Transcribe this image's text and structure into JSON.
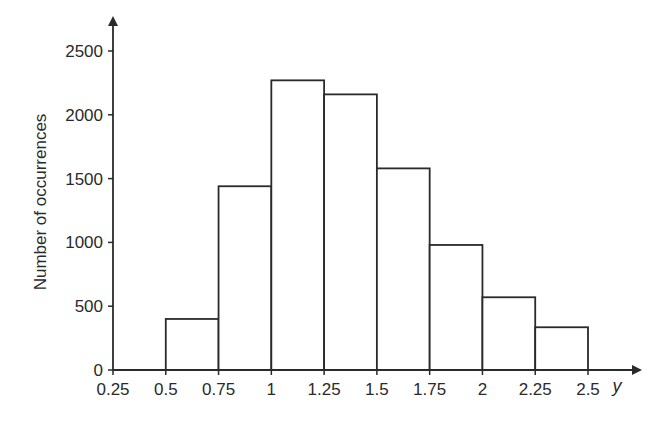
{
  "chart_data": {
    "type": "bar",
    "subtype": "histogram",
    "title": "",
    "xlabel": "y",
    "ylabel": "Number of occurrences",
    "bin_edges": [
      0.5,
      0.75,
      1,
      1.25,
      1.5,
      1.75,
      2,
      2.25,
      2.5
    ],
    "categories": [
      "0.5–0.75",
      "0.75–1",
      "1–1.25",
      "1.25–1.5",
      "1.5–1.75",
      "1.75–2",
      "2–2.25",
      "2.25–2.5"
    ],
    "values": [
      400,
      1440,
      2270,
      2160,
      1580,
      980,
      570,
      335
    ],
    "xlim": [
      0.25,
      2.6
    ],
    "ylim": [
      0,
      2750
    ],
    "x_ticks": [
      0.25,
      0.5,
      0.75,
      1,
      1.25,
      1.5,
      1.75,
      2,
      2.25,
      2.5
    ],
    "x_tick_labels": [
      "0.25",
      "0.5",
      "0.75",
      "1",
      "1.25",
      "1.5",
      "1.75",
      "2",
      "2.25",
      "2.5"
    ],
    "y_ticks": [
      0,
      500,
      1000,
      1500,
      2000,
      2500
    ],
    "y_tick_labels": [
      "0",
      "500",
      "1000",
      "1500",
      "2000",
      "2500"
    ],
    "grid": false,
    "legend": null,
    "colors": {
      "bar_fill": "#ffffff",
      "bar_edge": "#2a2a2a",
      "axis": "#2a2a2a"
    }
  }
}
